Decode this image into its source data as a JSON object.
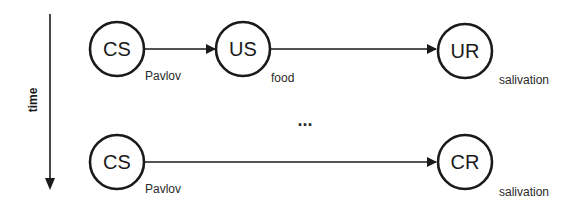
{
  "diagram": {
    "type": "classical-conditioning",
    "time_axis": {
      "label": "time",
      "direction": "down"
    },
    "rows": [
      {
        "nodes": [
          {
            "id": "cs1",
            "label": "CS",
            "caption": "Pavlov"
          },
          {
            "id": "us1",
            "label": "US",
            "caption": "food"
          },
          {
            "id": "ur1",
            "label": "UR",
            "caption": "salivation"
          }
        ],
        "edges": [
          {
            "from": "cs1",
            "to": "us1"
          },
          {
            "from": "us1",
            "to": "ur1"
          }
        ]
      },
      {
        "nodes": [
          {
            "id": "cs2",
            "label": "CS",
            "caption": "Pavlov"
          },
          {
            "id": "cr2",
            "label": "CR",
            "caption": "salivation"
          }
        ],
        "edges": [
          {
            "from": "cs2",
            "to": "cr2"
          }
        ]
      }
    ],
    "ellipsis": "...",
    "colors": {
      "stroke": "#1a1a1a",
      "background": "#ffffff"
    }
  }
}
